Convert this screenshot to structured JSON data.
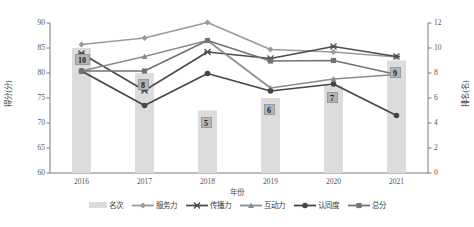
{
  "chart_data": {
    "type": "bar",
    "title": "",
    "xlabel": "年份",
    "ylabel": "得分(分)",
    "y2label": "排名(名)",
    "categories": [
      "2016",
      "2017",
      "2018",
      "2019",
      "2020",
      "2021"
    ],
    "ylim": [
      60,
      90
    ],
    "yticks": [
      "60",
      "65",
      "70",
      "75",
      "80",
      "85",
      "90"
    ],
    "y2lim": [
      0,
      12
    ],
    "y2ticks": [
      "0",
      "2",
      "4",
      "6",
      "8",
      "10",
      "12"
    ],
    "grid": false,
    "legend_position": "bottom",
    "bar_series": {
      "name": "名次",
      "axis": "right",
      "values": [
        10,
        8,
        5,
        6,
        7,
        9
      ],
      "labels": [
        "10",
        "8",
        "5",
        "6",
        "7",
        "9"
      ],
      "color": "#dcdcdc",
      "label_bg": "#b4b4b4"
    },
    "series": [
      {
        "name": "服务力",
        "marker": "diamond",
        "axis": "left",
        "color": "#9a9a9a",
        "values": [
          85.7,
          87.0,
          90.1,
          84.7,
          84.2,
          83.2
        ]
      },
      {
        "name": "传播力",
        "marker": "x",
        "axis": "left",
        "color": "#4d4d4d",
        "values": [
          83.9,
          76.5,
          84.2,
          82.9,
          85.3,
          83.3
        ]
      },
      {
        "name": "互动力",
        "marker": "triangle",
        "axis": "left",
        "color": "#8c8c8c",
        "values": [
          80.4,
          83.3,
          86.5,
          77.0,
          78.8,
          79.7
        ]
      },
      {
        "name": "认同度",
        "marker": "circle",
        "axis": "left",
        "color": "#464646",
        "values": [
          80.4,
          73.5,
          79.9,
          76.4,
          77.8,
          71.5
        ]
      },
      {
        "name": "总分",
        "marker": "square",
        "axis": "left",
        "color": "#737373",
        "values": [
          80.4,
          80.4,
          86.5,
          82.4,
          82.5,
          79.7
        ]
      }
    ]
  }
}
